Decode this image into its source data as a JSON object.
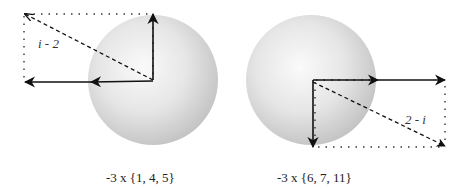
{
  "diagram": {
    "left": {
      "label": "i - 2",
      "caption": "-3 x {1, 4, 5}",
      "sphere": {
        "cx": 153,
        "cy": 80,
        "r": 65
      },
      "vectors": [
        "up",
        "left (two arrowheads)",
        "dashed diagonal to upper-left"
      ]
    },
    "right": {
      "label": "2 - i",
      "caption": "-3 x {6, 7, 11}",
      "sphere": {
        "cx": 311,
        "cy": 80,
        "r": 65
      },
      "vectors": [
        "right (two arrowheads)",
        "down",
        "dashed diagonal to lower-right"
      ]
    },
    "colors": {
      "sphere_light": "#f8f8f8",
      "sphere_dark": "#c8c8c8",
      "arrow": "#111111"
    }
  }
}
